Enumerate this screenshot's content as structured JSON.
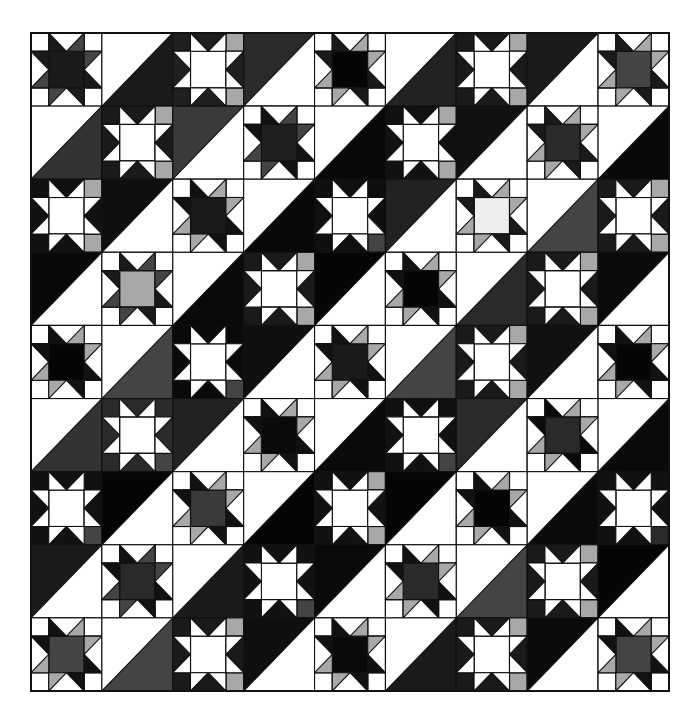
{
  "quilt": {
    "name": "Ohio star and half-square triangle quilt",
    "grid": {
      "rows": 9,
      "cols": 9,
      "x0": 31,
      "y0": 33,
      "x1": 669,
      "y1": 691
    },
    "colors": {
      "background": "#ffffff",
      "line": "#111111",
      "white": "#ffffff",
      "black": "#0a0a0a",
      "dark": "#1c1c1c",
      "charcoal": "#2a2a2a",
      "gray": "#444444",
      "midgray": "#777777",
      "lightgray": "#a8a8a8",
      "pale": "#e6e6e6"
    },
    "blocks": [
      [
        {
          "type": "starA",
          "center": "#1a1a1a",
          "point": "#1a1a1a",
          "accent": "#444444"
        },
        {
          "type": "hst",
          "dark": "BR",
          "color": "#1a1a1a"
        },
        {
          "type": "starB",
          "bg": "#1f1f1f",
          "accent": "#a8a8a8"
        },
        {
          "type": "hst",
          "dark": "TL",
          "color": "#2a2a2a"
        },
        {
          "type": "starA",
          "center": "#050505",
          "point": "#1a1a1a",
          "accent": "#a8a8a8"
        },
        {
          "type": "hst",
          "dark": "BR",
          "color": "#222222"
        },
        {
          "type": "starB",
          "bg": "#1a1a1a",
          "accent": "#a8a8a8"
        },
        {
          "type": "hst",
          "dark": "TL",
          "color": "#1a1a1a"
        },
        {
          "type": "starA",
          "center": "#444444",
          "point": "#1a1a1a",
          "accent": "#a8a8a8"
        }
      ],
      [
        {
          "type": "hst",
          "dark": "BR",
          "color": "#333333"
        },
        {
          "type": "starB",
          "bg": "#1a1a1a",
          "accent": "#a8a8a8"
        },
        {
          "type": "hst",
          "dark": "TL",
          "color": "#3a3a3a"
        },
        {
          "type": "starA",
          "center": "#1f1f1f",
          "point": "#111111",
          "accent": "#444444"
        },
        {
          "type": "hst",
          "dark": "BR",
          "color": "#080808"
        },
        {
          "type": "starB",
          "bg": "#111111",
          "accent": "#a8a8a8"
        },
        {
          "type": "hst",
          "dark": "TL",
          "color": "#111111"
        },
        {
          "type": "starA",
          "center": "#2a2a2a",
          "point": "#1a1a1a",
          "accent": "#a8a8a8"
        },
        {
          "type": "hst",
          "dark": "BR",
          "color": "#080808"
        }
      ],
      [
        {
          "type": "starB",
          "bg": "#111111",
          "accent": "#a8a8a8"
        },
        {
          "type": "hst",
          "dark": "TL",
          "color": "#0f0f0f"
        },
        {
          "type": "starA",
          "center": "#1a1a1a",
          "point": "#111111",
          "accent": "#a8a8a8"
        },
        {
          "type": "hst",
          "dark": "BR",
          "color": "#080808"
        },
        {
          "type": "starB",
          "bg": "#0f0f0f",
          "accent": "#444444"
        },
        {
          "type": "hst",
          "dark": "TL",
          "color": "#222222"
        },
        {
          "type": "starA",
          "center": "#eeeeee",
          "point": "#1a1a1a",
          "accent": "#a8a8a8"
        },
        {
          "type": "hst",
          "dark": "BR",
          "color": "#444444"
        },
        {
          "type": "starB",
          "bg": "#1a1a1a",
          "accent": "#a8a8a8"
        }
      ],
      [
        {
          "type": "hst",
          "dark": "TL",
          "color": "#080808"
        },
        {
          "type": "starA",
          "center": "#a8a8a8",
          "point": "#1a1a1a",
          "accent": "#444444"
        },
        {
          "type": "hst",
          "dark": "BR",
          "color": "#0a0a0a"
        },
        {
          "type": "starB",
          "bg": "#1a1a1a",
          "accent": "#a8a8a8"
        },
        {
          "type": "hst",
          "dark": "TL",
          "color": "#050505"
        },
        {
          "type": "starA",
          "center": "#050505",
          "point": "#111111",
          "accent": "#a8a8a8"
        },
        {
          "type": "hst",
          "dark": "BR",
          "color": "#2a2a2a"
        },
        {
          "type": "starB",
          "bg": "#1a1a1a",
          "accent": "#a8a8a8"
        },
        {
          "type": "hst",
          "dark": "TL",
          "color": "#0a0a0a"
        }
      ],
      [
        {
          "type": "starA",
          "center": "#050505",
          "point": "#111111",
          "accent": "#a8a8a8"
        },
        {
          "type": "hst",
          "dark": "BR",
          "color": "#444444"
        },
        {
          "type": "starB",
          "bg": "#0a0a0a",
          "accent": "#444444"
        },
        {
          "type": "hst",
          "dark": "TL",
          "color": "#0f0f0f"
        },
        {
          "type": "starA",
          "center": "#1a1a1a",
          "point": "#111111",
          "accent": "#a8a8a8"
        },
        {
          "type": "hst",
          "dark": "BR",
          "color": "#444444"
        },
        {
          "type": "starB",
          "bg": "#1a1a1a",
          "accent": "#a8a8a8"
        },
        {
          "type": "hst",
          "dark": "TL",
          "color": "#111111"
        },
        {
          "type": "starA",
          "center": "#050505",
          "point": "#111111",
          "accent": "#a8a8a8"
        }
      ],
      [
        {
          "type": "hst",
          "dark": "BR",
          "color": "#333333"
        },
        {
          "type": "starB",
          "bg": "#2a2a2a",
          "accent": "#444444"
        },
        {
          "type": "hst",
          "dark": "TL",
          "color": "#222222"
        },
        {
          "type": "starA",
          "center": "#0a0a0a",
          "point": "#111111",
          "accent": "#a8a8a8"
        },
        {
          "type": "hst",
          "dark": "BR",
          "color": "#0a0a0a"
        },
        {
          "type": "starB",
          "bg": "#111111",
          "accent": "#444444"
        },
        {
          "type": "hst",
          "dark": "TL",
          "color": "#2a2a2a"
        },
        {
          "type": "starA",
          "center": "#2a2a2a",
          "point": "#0a0a0a",
          "accent": "#a8a8a8"
        },
        {
          "type": "hst",
          "dark": "BR",
          "color": "#0a0a0a"
        }
      ],
      [
        {
          "type": "starB",
          "bg": "#111111",
          "accent": "#444444"
        },
        {
          "type": "hst",
          "dark": "TL",
          "color": "#050505"
        },
        {
          "type": "starA",
          "center": "#3a3a3a",
          "point": "#111111",
          "accent": "#a8a8a8"
        },
        {
          "type": "hst",
          "dark": "BR",
          "color": "#050505"
        },
        {
          "type": "starB",
          "bg": "#111111",
          "accent": "#a8a8a8"
        },
        {
          "type": "hst",
          "dark": "TL",
          "color": "#050505"
        },
        {
          "type": "starA",
          "center": "#050505",
          "point": "#111111",
          "accent": "#a8a8a8"
        },
        {
          "type": "hst",
          "dark": "BR",
          "color": "#0a0a0a"
        },
        {
          "type": "starB",
          "bg": "#111111",
          "accent": "#2a2a2a"
        }
      ],
      [
        {
          "type": "hst",
          "dark": "TL",
          "color": "#1a1a1a"
        },
        {
          "type": "starA",
          "center": "#2a2a2a",
          "point": "#111111",
          "accent": "#444444"
        },
        {
          "type": "hst",
          "dark": "BR",
          "color": "#1a1a1a"
        },
        {
          "type": "starB",
          "bg": "#111111",
          "accent": "#444444"
        },
        {
          "type": "hst",
          "dark": "TL",
          "color": "#0a0a0a"
        },
        {
          "type": "starA",
          "center": "#2a2a2a",
          "point": "#111111",
          "accent": "#a8a8a8"
        },
        {
          "type": "hst",
          "dark": "BR",
          "color": "#444444"
        },
        {
          "type": "starB",
          "bg": "#1a1a1a",
          "accent": "#a8a8a8"
        },
        {
          "type": "hst",
          "dark": "TL",
          "color": "#050505"
        }
      ],
      [
        {
          "type": "starA",
          "center": "#444444",
          "point": "#111111",
          "accent": "#a8a8a8"
        },
        {
          "type": "hst",
          "dark": "BR",
          "color": "#444444"
        },
        {
          "type": "starB",
          "bg": "#1a1a1a",
          "accent": "#a8a8a8"
        },
        {
          "type": "hst",
          "dark": "TL",
          "color": "#0f0f0f"
        },
        {
          "type": "starA",
          "center": "#0a0a0a",
          "point": "#111111",
          "accent": "#a8a8a8"
        },
        {
          "type": "hst",
          "dark": "BR",
          "color": "#1a1a1a"
        },
        {
          "type": "starB",
          "bg": "#1a1a1a",
          "accent": "#a8a8a8"
        },
        {
          "type": "hst",
          "dark": "TL",
          "color": "#0a0a0a"
        },
        {
          "type": "starA",
          "center": "#444444",
          "point": "#111111",
          "accent": "#a8a8a8"
        }
      ]
    ]
  }
}
